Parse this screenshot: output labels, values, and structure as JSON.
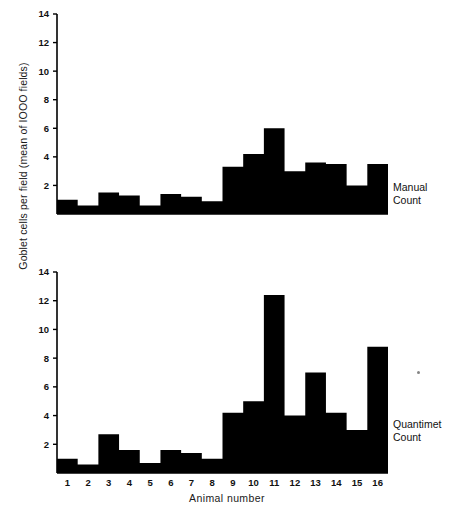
{
  "axes": {
    "y_title": "Goblet cells per field  (mean of IOOO fields)",
    "x_title": "Animal  number",
    "y_ticks": [
      "2",
      "4",
      "6",
      "8",
      "10",
      "12",
      "14"
    ],
    "x_ticks": [
      "1",
      "2",
      "3",
      "4",
      "5",
      "6",
      "7",
      "8",
      "9",
      "10",
      "11",
      "12",
      "13",
      "14",
      "15",
      "16"
    ]
  },
  "labels": {
    "manual_line1": "Manual",
    "manual_line2": "Count",
    "quantimet_line1": "Quantimet",
    "quantimet_line2": "Count"
  },
  "colors": {
    "bar": "#000000",
    "axis": "#000000",
    "background": "#ffffff",
    "text": "#111111"
  },
  "chart_data": [
    {
      "type": "bar",
      "title": "Manual Count",
      "xlabel": "Animal number",
      "ylabel": "Goblet cells per field (mean of IOOO fields)",
      "categories": [
        "1",
        "2",
        "3",
        "4",
        "5",
        "6",
        "7",
        "8",
        "9",
        "10",
        "11",
        "12",
        "13",
        "14",
        "15",
        "16"
      ],
      "values": [
        1.0,
        0.6,
        1.5,
        1.3,
        0.6,
        1.4,
        1.2,
        0.9,
        3.3,
        4.2,
        6.0,
        3.0,
        3.6,
        3.5,
        2.0,
        3.5
      ],
      "ylim": [
        0,
        14
      ],
      "ytick_step": 2,
      "grid": false,
      "legend": "none",
      "series_annotation": "Manual Count"
    },
    {
      "type": "bar",
      "title": "Quantimet Count",
      "xlabel": "Animal number",
      "ylabel": "Goblet cells per field (mean of IOOO fields)",
      "categories": [
        "1",
        "2",
        "3",
        "4",
        "5",
        "6",
        "7",
        "8",
        "9",
        "10",
        "11",
        "12",
        "13",
        "14",
        "15",
        "16"
      ],
      "values": [
        1.0,
        0.6,
        2.7,
        1.6,
        0.7,
        1.6,
        1.4,
        1.0,
        4.2,
        5.0,
        12.4,
        4.0,
        7.0,
        4.2,
        3.0,
        8.8
      ],
      "ylim": [
        0,
        14
      ],
      "ytick_step": 2,
      "grid": false,
      "legend": "none",
      "series_annotation": "Quantimet Count"
    }
  ]
}
